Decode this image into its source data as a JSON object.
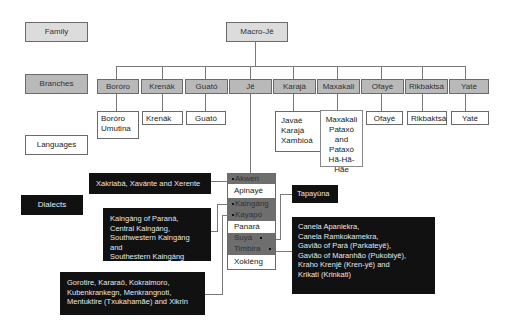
{
  "legend": {
    "family": "Family",
    "branches": "Branches",
    "languages": "Languages",
    "dialects": "Dialects"
  },
  "family": {
    "name": "Macro-Jê"
  },
  "branches": [
    {
      "name": "Boróro",
      "languages": [
        "Boróro",
        "Umutina"
      ]
    },
    {
      "name": "Krenák",
      "languages": [
        "Krenák"
      ]
    },
    {
      "name": "Guató",
      "languages": [
        "Guató"
      ]
    },
    {
      "name": "Jê",
      "languages": [
        "Akwen",
        "Apinayé",
        "Kaingáng",
        "Kayapó",
        "Panará",
        "Suyá",
        "Timbira",
        "Xokléng"
      ]
    },
    {
      "name": "Karajá",
      "languages": [
        "Javaé",
        "Karajá",
        "Xambioá"
      ]
    },
    {
      "name": "Maxakali",
      "languages": [
        "Maxakali",
        "Pataxó",
        "and",
        "Pataxó",
        "Hã-Hã-Hãe"
      ]
    },
    {
      "name": "Ofayé",
      "languages": [
        "Ofayé"
      ]
    },
    {
      "name": "Rikbaktsá",
      "languages": [
        "Rikbaktsá"
      ]
    },
    {
      "name": "Yaté",
      "languages": [
        "Yaté"
      ]
    }
  ],
  "dialects": {
    "akwen": "Xakriabá, Xavánte and Xerente",
    "kaingang": [
      "Kaingáng of Paraná,",
      "Central Kaingáng,",
      "Southwestern Kaingáng and",
      "Southestern Kaingáng"
    ],
    "kayapo": [
      "Gorotire, Kararaô, Kokraimoro,",
      "Kubenkrankegn, Menkrangnoti,",
      "Mentuktire (Txukahamãe) and Xikrin"
    ],
    "suya": "Tapayúna",
    "timbira": [
      "Canela Apaniekra,",
      "Canela Ramkokamekra,",
      "Gavião of Pará (Parkateyê),",
      "Gavião of Maranhão (Pukobiyê),",
      "Kraho Krenjê (Kren-yê) and",
      "Krikati (Krinkati)"
    ]
  },
  "colors": {
    "family_fill": "#dcdcdc",
    "branch_fill": "#b9b9b9",
    "dialect_group_fill": "#6e6e6e",
    "dialect_box_fill": "#111111",
    "line": "#7a7a7a"
  }
}
